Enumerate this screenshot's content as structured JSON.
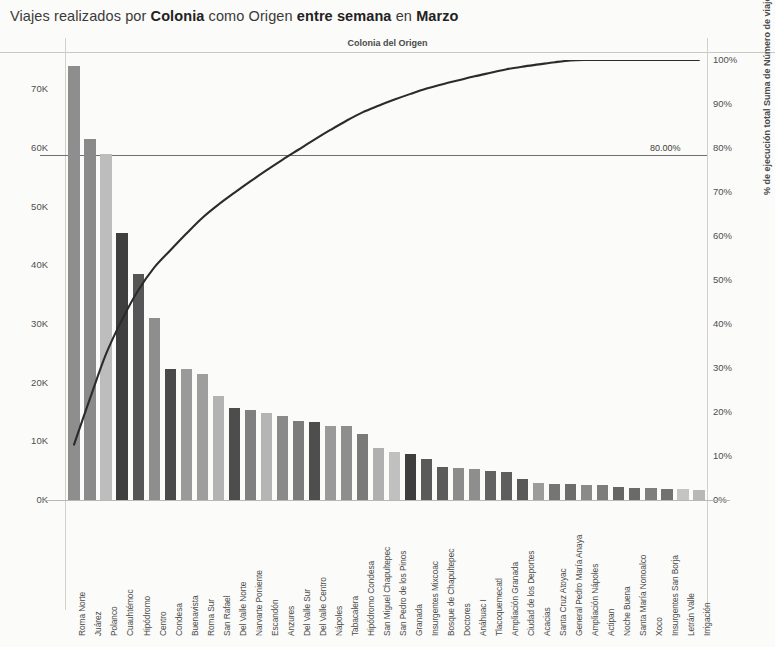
{
  "title": {
    "part1": "Viajes realizados por ",
    "bold1": "Colonia",
    "part2": " como Origen ",
    "bold2": "entre semana",
    "part3": " en ",
    "bold3": "Marzo"
  },
  "subtitle": "Colonia del Origen",
  "reference_label": "80.00%",
  "axes": {
    "left_title": "Número de viajes",
    "right_title": "% de ejecución total Suma de Número de viajes",
    "left_ticks": [
      "70K",
      "60K",
      "50K",
      "40K",
      "30K",
      "20K",
      "10K",
      "0K"
    ],
    "right_ticks": [
      "100%",
      "90%",
      "80%",
      "70%",
      "60%",
      "50%",
      "40%",
      "30%",
      "20%",
      "10%",
      "0%"
    ]
  },
  "chart_data": {
    "type": "bar",
    "title": "Viajes realizados por Colonia como Origen entre semana en Marzo",
    "subtitle": "Colonia del Origen",
    "xlabel": "Colonia del Origen",
    "ylabel": "Número de viajes",
    "y2label": "% de ejecución total Suma de Número de viajes",
    "ylim": [
      0,
      75000
    ],
    "y2lim": [
      0,
      100
    ],
    "grid": false,
    "legend": "none",
    "reference_line": {
      "axis": "y2",
      "value": 80,
      "label": "80.00%"
    },
    "categories": [
      "Roma Norte",
      "Juárez",
      "Polanco",
      "Cuauhtémoc",
      "Hipódromo",
      "Centro",
      "Condesa",
      "Buenavista",
      "Roma Sur",
      "San Rafael",
      "Del Valle Norte",
      "Narvarte Poniente",
      "Escandón",
      "Anzures",
      "Del Valle Sur",
      "Del Valle Centro",
      "Nápoles",
      "Tabacalera",
      "Hipódromo Condesa",
      "San Miguel Chapultepec",
      "San Pedro de los Pinos",
      "Granada",
      "Insurgentes Mixcoac",
      "Bosque de Chapultepec",
      "Doctores",
      "Anáhuac I",
      "Tlacoquemecatl",
      "Ampliación Granada",
      "Ciudad de los Deportes",
      "Acacias",
      "Santa Cruz Atoyac",
      "General Pedro María Anaya",
      "Ampliación Nápoles",
      "Actipan",
      "Noche Buena",
      "Santa María Nonoalco",
      "Xoco",
      "Insurgentes San Borja",
      "Letrán Valle",
      "Irrigación"
    ],
    "values": [
      74000,
      61500,
      59000,
      45500,
      38500,
      31000,
      22300,
      22300,
      21500,
      17700,
      15700,
      15300,
      14800,
      14300,
      13500,
      13300,
      12700,
      12600,
      11200,
      8900,
      8200,
      7800,
      7000,
      5600,
      5500,
      5300,
      4900,
      4700,
      3500,
      2900,
      2800,
      2700,
      2600,
      2500,
      2300,
      2100,
      2000,
      1900,
      1800,
      1700
    ],
    "cumulative_percent": [
      12.6,
      23.1,
      33.2,
      41.0,
      47.6,
      52.8,
      56.7,
      60.5,
      64.1,
      67.1,
      69.8,
      72.4,
      74.9,
      77.3,
      79.6,
      81.9,
      84.1,
      86.2,
      88.1,
      89.6,
      91.0,
      92.3,
      93.5,
      94.5,
      95.4,
      96.3,
      97.1,
      97.9,
      98.5,
      99.0,
      99.5,
      99.9,
      100.0,
      100.0,
      100.0,
      100.0,
      100.0,
      100.0,
      100.0,
      100.0
    ],
    "bar_shades": [
      "#8e8e8e",
      "#8a8a8a",
      "#bdbdbd",
      "#3f3f3f",
      "#565656",
      "#8e8e8e",
      "#4a4a4a",
      "#9a9a9a",
      "#9e9e9e",
      "#b3b3b3",
      "#4d4d4d",
      "#808080",
      "#b5b5b5",
      "#8a8a8a",
      "#7c7c7c",
      "#4e4e4e",
      "#9a9a9a",
      "#8e8e8e",
      "#7a7a7a",
      "#b0b0b0",
      "#c0c0c0",
      "#3e3e3e",
      "#5a5a5a",
      "#5c5c5c",
      "#8c8c8c",
      "#8e8e8e",
      "#636363",
      "#5e5e5e",
      "#595959",
      "#9c9c9c",
      "#757575",
      "#6d6d6d",
      "#8a8a8a",
      "#7d7d7d",
      "#666666",
      "#6a6a6a",
      "#7e7e7e",
      "#727272",
      "#c4c4c4",
      "#b8b8b8"
    ],
    "line_color": "#2b2b2b"
  }
}
